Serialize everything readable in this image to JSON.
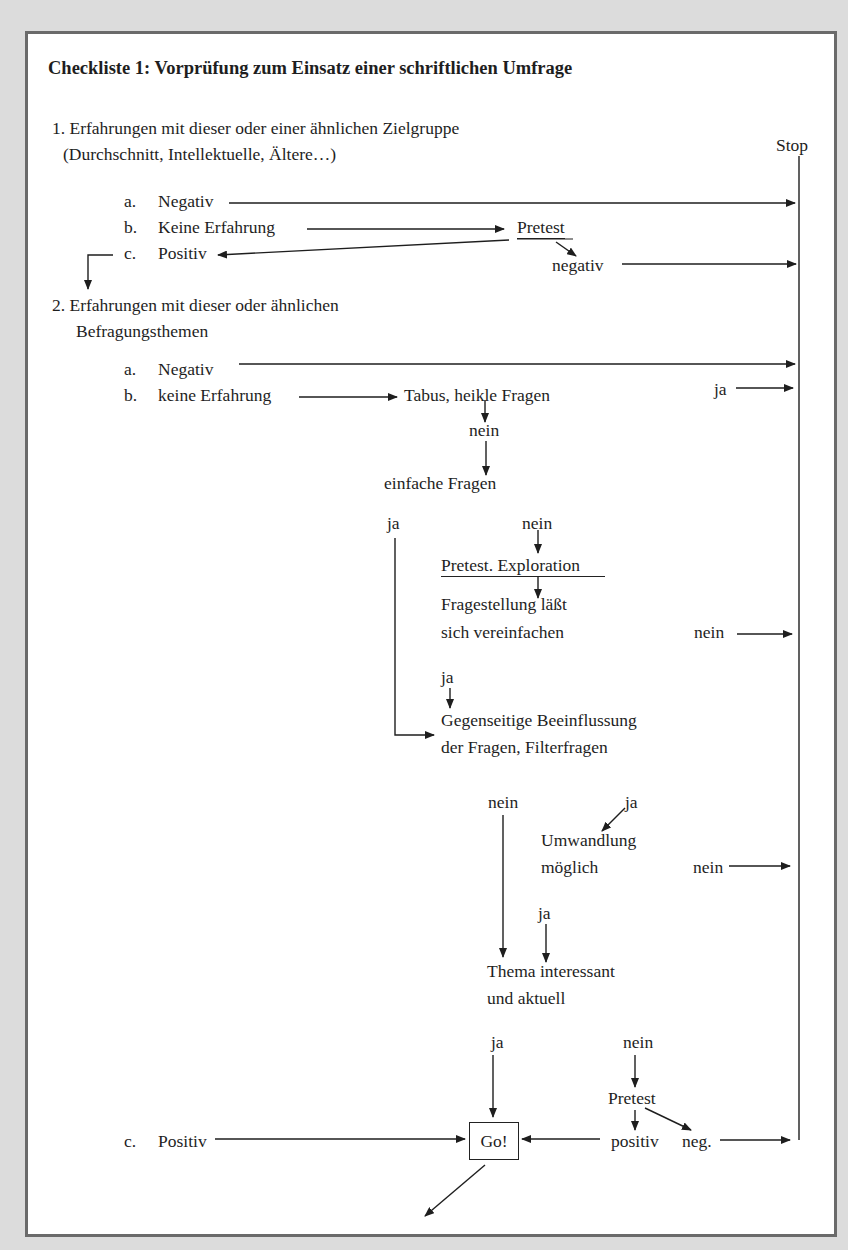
{
  "document": {
    "title": "Checkliste 1: Vorprüfung zum Einsatz einer schriftlichen Umfrage",
    "stop_label": "Stop",
    "go_label": "Go!"
  },
  "section1": {
    "heading_line1": "1. Erfahrungen mit dieser oder einer ähnlichen Zielgruppe",
    "heading_line2": "(Durchschnitt, Intellektuelle, Ältere…)",
    "items": [
      {
        "marker": "a.",
        "label": "Negativ"
      },
      {
        "marker": "b.",
        "label": "Keine Erfahrung"
      },
      {
        "marker": "c.",
        "label": "Positiv"
      }
    ],
    "pretest_label": "Pretest",
    "negativ_label": "negativ"
  },
  "section2": {
    "heading_line1": "2. Erfahrungen mit dieser oder ähnlichen",
    "heading_line2": "Befragungsthemen",
    "items": [
      {
        "marker": "a.",
        "label": "Negativ"
      },
      {
        "marker": "b.",
        "label": "keine Erfahrung"
      },
      {
        "marker": "c.",
        "label": "Positiv"
      }
    ],
    "nodes": {
      "tabus": "Tabus, heikle Fragen",
      "tabus_ja": "ja",
      "tabus_nein": "nein",
      "einfache": "einfache Fragen",
      "einfache_ja": "ja",
      "einfache_nein": "nein",
      "pretest_exploration": "Pretest. Exploration",
      "fragestellung_line1": "Fragestellung läßt",
      "fragestellung_line2": "sich vereinfachen",
      "fragestellung_nein": "nein",
      "fragestellung_ja": "ja",
      "gegenseitige_line1": "Gegenseitige Beeinflussung",
      "gegenseitige_line2": "der Fragen, Filterfragen",
      "gegenseitige_nein": "nein",
      "gegenseitige_ja": "ja",
      "umwandlung_line1": "Umwandlung",
      "umwandlung_line2": "möglich",
      "umwandlung_nein": "nein",
      "umwandlung_ja": "ja",
      "thema_line1": "Thema interessant",
      "thema_line2": "und aktuell",
      "thema_ja": "ja",
      "thema_nein": "nein",
      "pretest2": "Pretest",
      "positiv": "positiv",
      "neg": "neg."
    }
  },
  "colors": {
    "background": "#dcdcdc",
    "panel": "#ffffff",
    "border": "#6a6a6a",
    "ink": "#1e1e1e"
  }
}
